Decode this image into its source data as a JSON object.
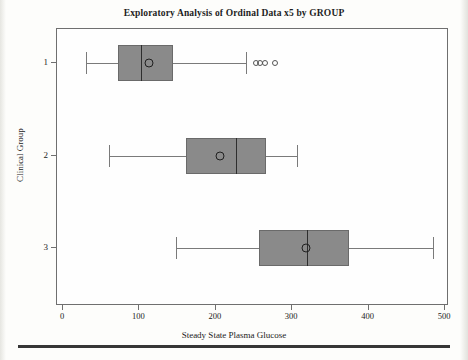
{
  "chart_data": {
    "type": "box",
    "title": "Exploratory Analysis of Ordinal Data x5 by GROUP",
    "xlabel": "Steady State Plasma Glucose",
    "ylabel": "Clinical Group",
    "orientation": "horizontal",
    "xlim": [
      0,
      500
    ],
    "xticks": [
      0,
      100,
      200,
      300,
      400,
      500
    ],
    "xtick_labels": [
      "0",
      "100",
      "200",
      "300",
      "400",
      "500"
    ],
    "categories": [
      "1",
      "2",
      "3"
    ],
    "grid": false,
    "legend": null,
    "box_fill": "#8a8a8a",
    "box_edge": "#6a6a6a",
    "median_color": "#2e2e2e",
    "mean_marker": "circle-outline",
    "boxes": [
      {
        "group": "1",
        "whisker_low": 30,
        "q1": 72,
        "median": 102,
        "q3": 144,
        "whisker_high": 240,
        "mean": 113,
        "outliers": [
          253,
          258,
          264,
          278
        ]
      },
      {
        "group": "2",
        "whisker_low": 60,
        "q1": 161,
        "median": 226,
        "q3": 266,
        "whisker_high": 306,
        "mean": 205,
        "outliers": []
      },
      {
        "group": "3",
        "whisker_low": 148,
        "q1": 257,
        "median": 319,
        "q3": 374,
        "whisker_high": 484,
        "mean": 318,
        "outliers": []
      }
    ]
  }
}
